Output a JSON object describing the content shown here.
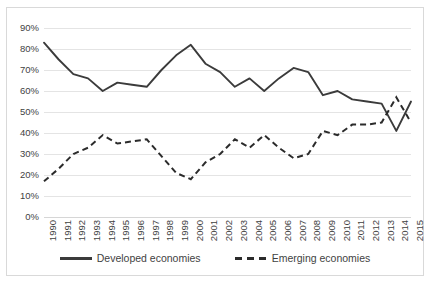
{
  "chart_data": {
    "type": "line",
    "title": "",
    "xlabel": "",
    "ylabel": "",
    "ylim": [
      0,
      90
    ],
    "ytick_labels": [
      "90%",
      "80%",
      "70%",
      "60%",
      "50%",
      "40%",
      "30%",
      "20%",
      "10%",
      "0%"
    ],
    "ytick_values": [
      90,
      80,
      70,
      60,
      50,
      40,
      30,
      20,
      10,
      0
    ],
    "grid": true,
    "legend_position": "bottom",
    "categories": [
      "1990",
      "1991",
      "1992",
      "1993",
      "1994",
      "1995",
      "1996",
      "1997",
      "1998",
      "1999",
      "2000",
      "2001",
      "2002",
      "2003",
      "2004",
      "2005",
      "2006",
      "2007",
      "2008",
      "2009",
      "2010",
      "2011",
      "2012",
      "2013",
      "2014",
      "2015"
    ],
    "series": [
      {
        "name": "Developed economies",
        "style": "solid",
        "color": "#3b3b3b",
        "values": [
          83,
          75,
          68,
          66,
          60,
          64,
          63,
          62,
          70,
          77,
          82,
          73,
          69,
          62,
          66,
          60,
          66,
          71,
          69,
          58,
          60,
          56,
          55,
          54,
          41,
          55
        ]
      },
      {
        "name": "Emerging economies",
        "style": "dashed",
        "color": "#2b2b2b",
        "values": [
          17,
          23,
          30,
          33,
          39,
          35,
          36,
          37,
          29,
          21,
          18,
          26,
          30,
          37,
          33,
          39,
          33,
          28,
          30,
          41,
          39,
          44,
          44,
          45,
          57,
          45
        ]
      }
    ]
  },
  "legend": {
    "items": [
      {
        "label": "Developed economies",
        "style": "solid"
      },
      {
        "label": "Emerging economies",
        "style": "dashed"
      }
    ]
  }
}
